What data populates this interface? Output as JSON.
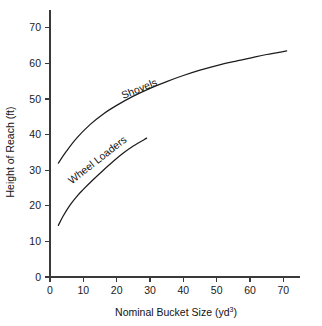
{
  "chart_data": {
    "type": "line",
    "title": "",
    "xlabel": "Nominal Bucket Size (yd",
    "xlabel_superscript": "3",
    "xlabel_suffix": ")",
    "ylabel": "Height of Reach (ft)",
    "xlim": [
      0,
      75
    ],
    "ylim": [
      0,
      75
    ],
    "xticks": [
      0,
      10,
      20,
      30,
      40,
      50,
      60,
      70
    ],
    "yticks": [
      0,
      10,
      20,
      30,
      40,
      50,
      60,
      70
    ],
    "xtick_labels": [
      "0",
      "10",
      "20",
      "30",
      "40",
      "50",
      "60",
      "70"
    ],
    "ytick_labels": [
      "0",
      "10",
      "20",
      "30",
      "40",
      "50",
      "60",
      "70"
    ],
    "grid": false,
    "legend": "inline-curve-labels",
    "line_color": "#1c1c1c",
    "axis_color": "#3a3a3a",
    "background": "#ffffff",
    "series": [
      {
        "name": "Shovels",
        "label": "Shovels",
        "label_x": 22,
        "label_y": 50,
        "label_rotation": -22,
        "x": [
          2.5,
          5,
          8,
          12,
          16,
          20,
          25,
          30,
          35,
          40,
          45,
          50,
          55,
          60,
          65,
          71
        ],
        "y": [
          32.0,
          35.4,
          39.0,
          42.8,
          45.8,
          48.2,
          50.8,
          53.0,
          54.9,
          56.6,
          58.1,
          59.4,
          60.5,
          61.5,
          62.5,
          63.5
        ]
      },
      {
        "name": "Wheel Loaders",
        "label": "Wheel Loaders",
        "label_x": 6.5,
        "label_y": 26,
        "label_rotation": -38,
        "x": [
          2.5,
          4,
          6,
          8,
          10,
          13,
          16,
          19,
          22,
          25,
          29
        ],
        "y": [
          14.5,
          17.2,
          20.2,
          22.6,
          24.6,
          27.4,
          30.0,
          32.5,
          34.8,
          36.8,
          39.0
        ]
      }
    ]
  }
}
